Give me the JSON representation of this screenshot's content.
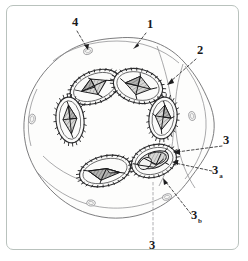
{
  "figure": {
    "kind": "labeled-scientific-diagram",
    "frame": {
      "border_color": "#b9c2bd",
      "background_color": "#ffffff",
      "corner_radius_px": 7
    },
    "palette": {
      "outline": "#6e6e70",
      "spore_wall": "#2e2e30",
      "core_dark": "#9a9a99",
      "core_mid": "#c3c3c1",
      "core_light": "#e6e6e4",
      "label_text": "#19191b",
      "leader_line": "#2a2a2c"
    },
    "labels": [
      {
        "id": "label-1",
        "text": "1",
        "subscript": "",
        "x": 143,
        "y": 22,
        "leader": "M 139 27 L 128 41",
        "arrow_at": [
          126,
          43
        ],
        "arrow_angle": 230,
        "points_to": "outer cell boundary"
      },
      {
        "id": "label-2",
        "text": "2",
        "subscript": "",
        "x": 193,
        "y": 48,
        "leader": "M 189 53 L 163 76",
        "arrow_at": [
          160,
          79
        ],
        "arrow_angle": 222,
        "points_to": "cytoplasm interior region"
      },
      {
        "id": "label-3",
        "text": "3",
        "subscript": "",
        "x": 219,
        "y": 138,
        "leader": "M 215 140 L 170 146",
        "arrow_at": [
          167,
          146
        ],
        "arrow_angle": 188,
        "points_to": "spore body outer wall"
      },
      {
        "id": "label-3a",
        "text": "3",
        "subscript": "a",
        "x": 208,
        "y": 168,
        "leader": "M 205 165 L 168 157",
        "arrow_at": [
          166,
          157
        ],
        "arrow_angle": 192,
        "points_to": "spore inner compartment a"
      },
      {
        "id": "label-3b",
        "text": "3",
        "subscript": "b",
        "x": 187,
        "y": 213,
        "leader": "M 184 208 L 158 175",
        "arrow_at": [
          157,
          173
        ],
        "arrow_angle": 232,
        "points_to": "spore inner compartment b"
      },
      {
        "id": "label-3c",
        "text": "3",
        "subscript": "c",
        "x": 145,
        "y": 243,
        "leader": "M 146 234 L 146 176",
        "arrow_at": [
          146,
          175
        ],
        "arrow_angle": 270,
        "points_to": "spore inner compartment c"
      },
      {
        "id": "label-4",
        "text": "4",
        "subscript": "",
        "x": 68,
        "y": 20,
        "leader": "M 70 25 L 80 42",
        "arrow_at": [
          81,
          44
        ],
        "arrow_angle": 300,
        "points_to": "membrane pore"
      }
    ],
    "spores": [
      {
        "id": "spore-upper-left",
        "cx": 88,
        "cy": 81,
        "rx": 26,
        "ry": 16,
        "rotation": -22,
        "core": "quad-star"
      },
      {
        "id": "spore-upper-right",
        "cx": 131,
        "cy": 80,
        "rx": 25,
        "ry": 17,
        "rotation": 14,
        "core": "quad-star"
      },
      {
        "id": "spore-right",
        "cx": 156,
        "cy": 112,
        "rx": 14,
        "ry": 21,
        "rotation": 8,
        "core": "quad-star"
      },
      {
        "id": "spore-left",
        "cx": 63,
        "cy": 114,
        "rx": 14,
        "ry": 23,
        "rotation": -6,
        "core": "diamond"
      },
      {
        "id": "spore-lower-left",
        "cx": 98,
        "cy": 165,
        "rx": 26,
        "ry": 15,
        "rotation": -14,
        "core": "tri-radiate"
      },
      {
        "id": "spore-lower-right",
        "cx": 147,
        "cy": 155,
        "rx": 23,
        "ry": 16,
        "rotation": -18,
        "core": "compartmented"
      }
    ],
    "pores": [
      {
        "id": "pore-top",
        "cx": 81,
        "cy": 45,
        "rx": 4.5,
        "ry": 3.2,
        "rotation": -20
      },
      {
        "id": "pore-left",
        "cx": 25,
        "cy": 113,
        "rx": 3.4,
        "ry": 4.8,
        "rotation": 10
      },
      {
        "id": "pore-right",
        "cx": 185,
        "cy": 110,
        "rx": 3.2,
        "ry": 4.4,
        "rotation": -12
      },
      {
        "id": "pore-bottom-left",
        "cx": 84,
        "cy": 197,
        "rx": 4.2,
        "ry": 3.0,
        "rotation": 8
      },
      {
        "id": "pore-bottom-right",
        "cx": 160,
        "cy": 191,
        "rx": 4.6,
        "ry": 3.0,
        "rotation": -14
      }
    ]
  }
}
